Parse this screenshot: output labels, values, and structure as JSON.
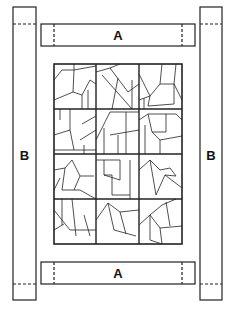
{
  "diagram": {
    "type": "quilt-assembly",
    "labels": {
      "top_strip": "A",
      "bottom_strip": "A",
      "left_strip": "B",
      "right_strip": "B"
    },
    "grid": {
      "rows": 4,
      "cols": 3
    },
    "colors": {
      "line": "#222222",
      "background": "#ffffff"
    }
  }
}
